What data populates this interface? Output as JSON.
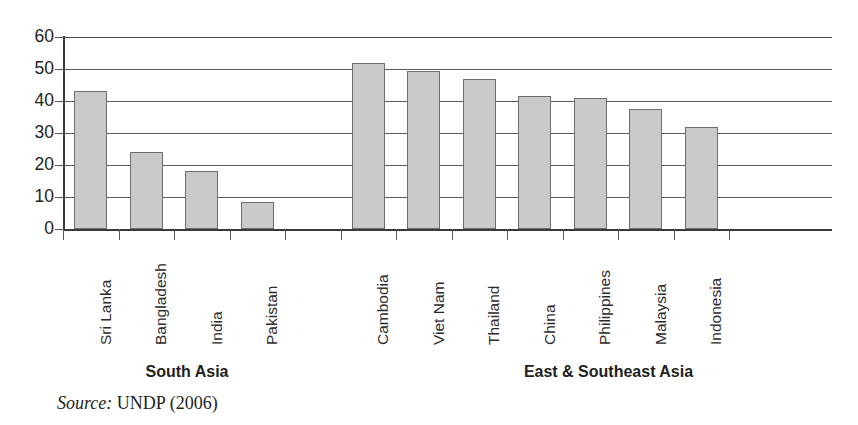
{
  "chart_data": {
    "type": "bar",
    "title": "",
    "subtitle": "",
    "xlabel": "",
    "ylabel": "",
    "ylim": [
      0,
      60
    ],
    "yticks": [
      0,
      10,
      20,
      30,
      40,
      50,
      60
    ],
    "ytick_labels": [
      "0",
      "10",
      "20",
      "30",
      "40",
      "50",
      "60"
    ],
    "grid": true,
    "legend": "none",
    "bar_color": "#c9c9c9",
    "bar_edge_color": "#6d6e70",
    "axis_color": "#3a3a3c",
    "grid_color": "#58595b",
    "categories": [
      "Sri Lanka",
      "Bangladesh",
      "India",
      "Pakistan",
      "",
      "Cambodia",
      "Viet Nam",
      "Thailand",
      "China",
      "Philippines",
      "Malaysia",
      "Indonesia"
    ],
    "values": [
      43,
      24,
      18,
      8.5,
      null,
      52,
      49.5,
      47,
      41.5,
      41,
      37.5,
      32
    ],
    "groups": [
      {
        "label": "South Asia",
        "categories": [
          "Sri Lanka",
          "Bangladesh",
          "India",
          "Pakistan"
        ]
      },
      {
        "label": "East & Southeast Asia",
        "categories": [
          "Cambodia",
          "Viet Nam",
          "Thailand",
          "China",
          "Philippines",
          "Malaysia",
          "Indonesia"
        ]
      }
    ]
  },
  "axis": {
    "ytick_labels": [
      "60",
      "50",
      "40",
      "30",
      "20",
      "10",
      "0"
    ]
  },
  "categories": [
    {
      "label": "Sri Lanka",
      "value": 43
    },
    {
      "label": "Bangladesh",
      "value": 24
    },
    {
      "label": "India",
      "value": 18
    },
    {
      "label": "Pakistan",
      "value": 8.5
    },
    {
      "label": "Cambodia",
      "value": 52
    },
    {
      "label": "Viet Nam",
      "value": 49.5
    },
    {
      "label": "Thailand",
      "value": 47
    },
    {
      "label": "China",
      "value": 41.5
    },
    {
      "label": "Philippines",
      "value": 41
    },
    {
      "label": "Malaysia",
      "value": 37.5
    },
    {
      "label": "Indonesia",
      "value": 32
    }
  ],
  "groups": [
    {
      "label": "South Asia"
    },
    {
      "label": "East & Southeast Asia"
    }
  ],
  "source": {
    "label": "Source:",
    "value": "UNDP (2006)"
  }
}
